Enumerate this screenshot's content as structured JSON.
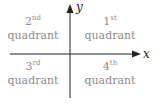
{
  "axes": {
    "x_label": "x",
    "y_label": "y"
  },
  "quadrants": [
    {
      "num": "1",
      "suffix": "st",
      "label": "quadrant"
    },
    {
      "num": "2",
      "suffix": "nd",
      "label": "quadrant"
    },
    {
      "num": "3",
      "suffix": "rd",
      "label": "quadrant"
    },
    {
      "num": "4",
      "suffix": "th",
      "label": "quadrant"
    }
  ],
  "colors": {
    "axis": "#222222",
    "text": "#8c8c8c"
  }
}
